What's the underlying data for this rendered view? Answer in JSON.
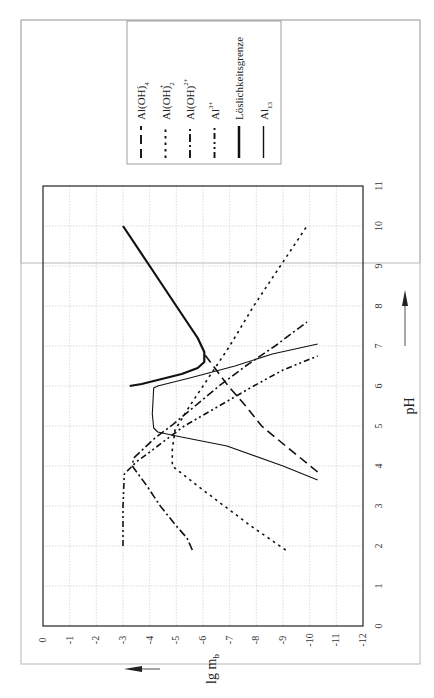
{
  "chart_data": {
    "type": "line",
    "orientation": "rotated 90 degrees counter-clockwise (pH runs bottom-to-top on screen)",
    "title": "",
    "xlabel": "pH",
    "ylabel": "lg m_b",
    "xlim": [
      0,
      11
    ],
    "ylim": [
      -12,
      0
    ],
    "x_ticks": [
      "0",
      "1",
      "2",
      "3",
      "4",
      "5",
      "6",
      "7",
      "8",
      "9",
      "10",
      "11"
    ],
    "y_ticks": [
      "0",
      "-1",
      "-2",
      "-3",
      "-4",
      "-5",
      "-6",
      "-7",
      "-8",
      "-9",
      "-10",
      "-11",
      "-12"
    ],
    "grid": true,
    "legend_position": "top-right (upper area on rotated page)",
    "series": [
      {
        "name": "Al(OH)4-",
        "label_main": "Al(OH)",
        "label_sub": "4",
        "label_sup": "-",
        "style": "long-dash",
        "points": [
          [
            3.85,
            -10.3
          ],
          [
            4.5,
            -9.1
          ],
          [
            5.0,
            -8.2
          ],
          [
            5.5,
            -7.6
          ],
          [
            6.0,
            -6.95
          ],
          [
            6.4,
            -6.5
          ],
          [
            6.8,
            -6.05
          ]
        ]
      },
      {
        "name": "Al(OH)2+",
        "label_main": "Al(OH)",
        "label_sub": "2",
        "label_sup": "+",
        "style": "dotted",
        "points": [
          [
            1.9,
            -9.1
          ],
          [
            2.5,
            -7.8
          ],
          [
            3.0,
            -6.8
          ],
          [
            3.5,
            -5.8
          ],
          [
            4.0,
            -4.85
          ],
          [
            4.4,
            -4.85
          ],
          [
            4.9,
            -4.95
          ],
          [
            5.5,
            -5.5
          ],
          [
            6.0,
            -6.0
          ],
          [
            7.0,
            -7.0
          ],
          [
            8.0,
            -7.9
          ],
          [
            9.0,
            -8.9
          ],
          [
            10.0,
            -9.9
          ]
        ]
      },
      {
        "name": "Al(OH)2+ (dihydroxy)",
        "label_main": "Al(OH)",
        "label_sub": "",
        "label_sup": "2+",
        "style": "dash-dot",
        "points": [
          [
            1.9,
            -5.6
          ],
          [
            2.2,
            -5.4
          ],
          [
            2.5,
            -5.0
          ],
          [
            3.0,
            -4.4
          ],
          [
            3.5,
            -3.9
          ],
          [
            4.0,
            -3.35
          ],
          [
            4.2,
            -3.4
          ],
          [
            4.7,
            -4.2
          ],
          [
            5.0,
            -4.8
          ],
          [
            5.5,
            -5.7
          ],
          [
            6.0,
            -6.6
          ],
          [
            6.5,
            -7.6
          ],
          [
            7.0,
            -8.7
          ],
          [
            7.6,
            -9.9
          ]
        ]
      },
      {
        "name": "Al3+",
        "label_main": "Al",
        "label_sub": "",
        "label_sup": "3+",
        "style": "dash-dot-dot",
        "points": [
          [
            2.0,
            -3.0
          ],
          [
            3.0,
            -3.0
          ],
          [
            3.8,
            -3.05
          ],
          [
            4.1,
            -3.5
          ],
          [
            4.5,
            -4.3
          ],
          [
            5.0,
            -5.3
          ],
          [
            5.5,
            -6.6
          ],
          [
            6.0,
            -7.9
          ],
          [
            6.4,
            -9.0
          ],
          [
            6.75,
            -10.3
          ]
        ]
      },
      {
        "name": "Löslichkeitsgrenze",
        "label_main": "Löslichkeitsgrenze",
        "label_sub": "",
        "label_sup": "",
        "style": "solid-thick",
        "points": [
          [
            10.0,
            -3.0
          ],
          [
            9.0,
            -4.0
          ],
          [
            8.0,
            -5.0
          ],
          [
            7.2,
            -5.8
          ],
          [
            6.85,
            -6.05
          ],
          [
            6.6,
            -6.05
          ],
          [
            6.45,
            -5.8
          ],
          [
            6.3,
            -5.2
          ],
          [
            6.15,
            -4.3
          ],
          [
            6.05,
            -3.7
          ],
          [
            6.0,
            -3.25
          ]
        ]
      },
      {
        "name": "Al13",
        "label_main": "Al",
        "label_sub": "13",
        "label_sup": "",
        "style": "solid-thin",
        "points": [
          [
            3.65,
            -10.3
          ],
          [
            4.0,
            -9.0
          ],
          [
            4.5,
            -6.9
          ],
          [
            4.75,
            -5.0
          ],
          [
            4.85,
            -4.3
          ],
          [
            4.95,
            -4.15
          ],
          [
            5.3,
            -4.1
          ],
          [
            5.95,
            -4.15
          ],
          [
            6.0,
            -4.3
          ],
          [
            6.2,
            -5.5
          ],
          [
            6.5,
            -7.2
          ],
          [
            6.8,
            -8.6
          ],
          [
            7.05,
            -10.3
          ]
        ]
      }
    ]
  },
  "axes": {
    "x_title": "pH",
    "y_title_main": "lg m",
    "y_title_sub": "b"
  }
}
